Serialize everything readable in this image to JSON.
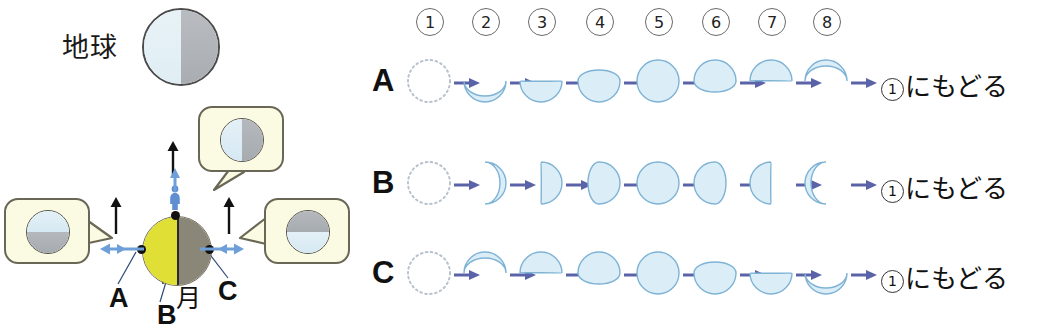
{
  "left_diagram": {
    "earth_label": "地球",
    "moon_label": "月",
    "point_labels": {
      "a": "A",
      "b": "B",
      "c": "C"
    },
    "earth_globe": {
      "name": "earth",
      "left_half_color": "#e3eff5",
      "right_half_color": "#b0b4b8",
      "outline_color": "#4b4b4b"
    },
    "moon_globe": {
      "name": "moon",
      "lit_half_color": "#e0df35",
      "dark_half_color": "#8a8778",
      "outline_color": "#6e6a58"
    },
    "observer_bubbles": [
      {
        "id": "top",
        "view": "left-light-right-dark",
        "top_color": "#e4f0f7",
        "bottom_color": "#b5b9bd",
        "split": "vertical"
      },
      {
        "id": "left",
        "view": "top-light-bottom-dark",
        "top_color": "#e4f0f7",
        "bottom_color": "#b5b9bd",
        "split": "horizontal"
      },
      {
        "id": "right",
        "view": "top-dark-bottom-light",
        "top_color": "#b5b9bd",
        "bottom_color": "#e4f0f7",
        "split": "horizontal"
      }
    ],
    "bubble_fill": "#fbfbe4",
    "bubble_border": "#6b6757",
    "arrow_color_blue": "#5b86c9",
    "arrow_color_black": "#111111"
  },
  "right_diagram": {
    "step_numbers": [
      "1",
      "2",
      "3",
      "4",
      "5",
      "6",
      "7",
      "8"
    ],
    "step_number_glyphs": [
      "①",
      "②",
      "③",
      "④",
      "⑤",
      "⑥",
      "⑦",
      "⑧"
    ],
    "loop_text": "にもどる",
    "loop_ring": "1",
    "phase_fill": "#dbeef8",
    "phase_stroke": "#7fb3d5",
    "arrow_color": "#5a63a8",
    "rows": [
      {
        "label": "A",
        "phases": [
          {
            "step": 1,
            "shape": "new-dotted"
          },
          {
            "step": 2,
            "shape": "crescent-bottom-thin"
          },
          {
            "step": 3,
            "shape": "half-bottom"
          },
          {
            "step": 4,
            "shape": "gibbous-bottom"
          },
          {
            "step": 5,
            "shape": "full"
          },
          {
            "step": 6,
            "shape": "gibbous-top"
          },
          {
            "step": 7,
            "shape": "half-top"
          },
          {
            "step": 8,
            "shape": "crescent-top-thin"
          }
        ]
      },
      {
        "label": "B",
        "phases": [
          {
            "step": 1,
            "shape": "new-dotted"
          },
          {
            "step": 2,
            "shape": "crescent-right-thin"
          },
          {
            "step": 3,
            "shape": "half-right"
          },
          {
            "step": 4,
            "shape": "gibbous-right"
          },
          {
            "step": 5,
            "shape": "full"
          },
          {
            "step": 6,
            "shape": "gibbous-left"
          },
          {
            "step": 7,
            "shape": "half-left"
          },
          {
            "step": 8,
            "shape": "crescent-left-thin"
          }
        ]
      },
      {
        "label": "C",
        "phases": [
          {
            "step": 1,
            "shape": "new-dotted"
          },
          {
            "step": 2,
            "shape": "crescent-top-thin"
          },
          {
            "step": 3,
            "shape": "half-top"
          },
          {
            "step": 4,
            "shape": "gibbous-top"
          },
          {
            "step": 5,
            "shape": "full"
          },
          {
            "step": 6,
            "shape": "gibbous-bottom"
          },
          {
            "step": 7,
            "shape": "half-bottom"
          },
          {
            "step": 8,
            "shape": "crescent-bottom-thin"
          }
        ]
      }
    ]
  }
}
